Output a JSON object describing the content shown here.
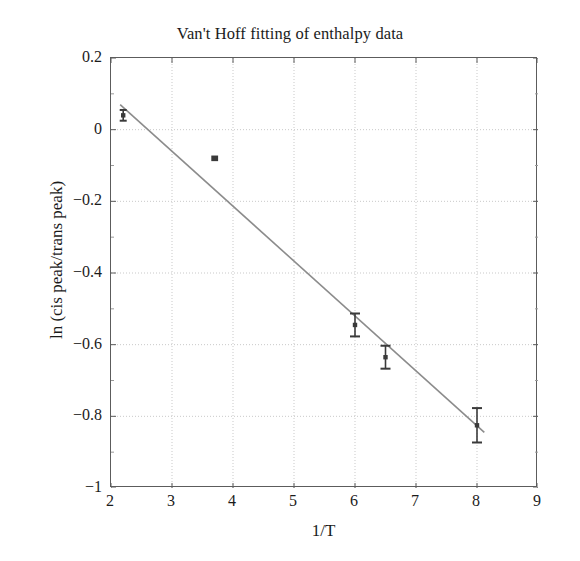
{
  "chart_data": {
    "type": "scatter",
    "title": "Van't Hoff fitting of enthalpy data",
    "xlabel": "1/T",
    "ylabel": "ln (cis peak/trans peak)",
    "xlim": [
      2,
      9
    ],
    "ylim": [
      -1,
      0.2
    ],
    "xticks": [
      2,
      3,
      4,
      5,
      6,
      7,
      8,
      9
    ],
    "yticks": [
      0.2,
      0,
      -0.2,
      -0.4,
      -0.6,
      -0.8,
      -1
    ],
    "xtick_labels": [
      "2",
      "3",
      "4",
      "5",
      "6",
      "7",
      "8",
      "9"
    ],
    "ytick_labels": [
      "0.2",
      "0",
      "−0.2",
      "−0.4",
      "−0.6",
      "−0.8",
      "−1"
    ],
    "grid": true,
    "legend": false,
    "series": [
      {
        "name": "enthalpy data",
        "marker": "square",
        "color": "#3a3a3a",
        "points": [
          {
            "x": 2.2,
            "y": 0.04,
            "yerr": 0.015
          },
          {
            "x": 3.7,
            "y": -0.08,
            "yerr": 0.012
          },
          {
            "x": 6.0,
            "y": -0.545,
            "yerr": 0.032
          },
          {
            "x": 6.5,
            "y": -0.635,
            "yerr": 0.032
          },
          {
            "x": 8.0,
            "y": -0.825,
            "yerr": 0.048
          }
        ]
      },
      {
        "name": "Van't Hoff linear fit",
        "type": "line",
        "color": "#8c8c8c",
        "x": [
          2.15,
          8.12
        ],
        "y": [
          0.07,
          -0.845
        ],
        "slope": -0.1528,
        "intercept": 0.3986
      }
    ]
  },
  "figure": {
    "background_color": "#ffffff",
    "axis_color": "#5c5c5c",
    "grid_color": "#c9c9c9",
    "fit_line_color": "#8c8c8c",
    "marker_color": "#3a3a3a",
    "text_color": "#1b1b1b"
  }
}
